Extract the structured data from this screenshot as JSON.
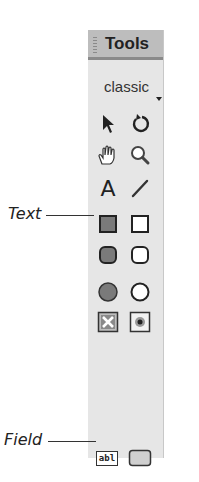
{
  "panel": {
    "title": "Tools",
    "mode_selector": {
      "value": "classic"
    }
  },
  "tools": [
    {
      "name": "pointer",
      "icon": "arrow-pointer-icon"
    },
    {
      "name": "rotate",
      "icon": "rotate-icon"
    },
    {
      "name": "hand",
      "icon": "hand-icon"
    },
    {
      "name": "zoom",
      "icon": "magnifier-icon"
    },
    {
      "name": "text",
      "icon": "text-A-icon",
      "glyph": "A"
    },
    {
      "name": "line",
      "icon": "line-icon"
    },
    {
      "name": "filled-rectangle",
      "icon": "filled-rectangle-icon"
    },
    {
      "name": "rectangle",
      "icon": "rectangle-icon"
    },
    {
      "name": "filled-rounded-rectangle",
      "icon": "filled-rounded-rectangle-icon"
    },
    {
      "name": "rounded-rectangle",
      "icon": "rounded-rectangle-icon"
    },
    {
      "name": "filled-oval",
      "icon": "filled-oval-icon"
    },
    {
      "name": "oval",
      "icon": "oval-icon"
    },
    {
      "name": "checkbox",
      "icon": "checkbox-icon"
    },
    {
      "name": "radio-button",
      "icon": "radio-button-icon"
    },
    {
      "name": "field",
      "icon": "field-icon",
      "glyph": "abl"
    },
    {
      "name": "button",
      "icon": "button-icon"
    }
  ],
  "callouts": {
    "text": "Text",
    "field": "Field"
  }
}
